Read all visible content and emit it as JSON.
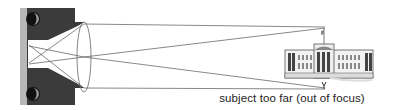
{
  "diagram": {
    "caption": "subject too far (out of focus)",
    "elements": {
      "camera": "camera-body",
      "film": "film-plane",
      "lens": "biconvex-lens",
      "subject": "building"
    },
    "colors": {
      "camera_body": "#3b3b3b",
      "film_strip": "#b8b8b8",
      "ray_lines": "#555555",
      "building": "#666666",
      "caption": "#222222"
    }
  }
}
